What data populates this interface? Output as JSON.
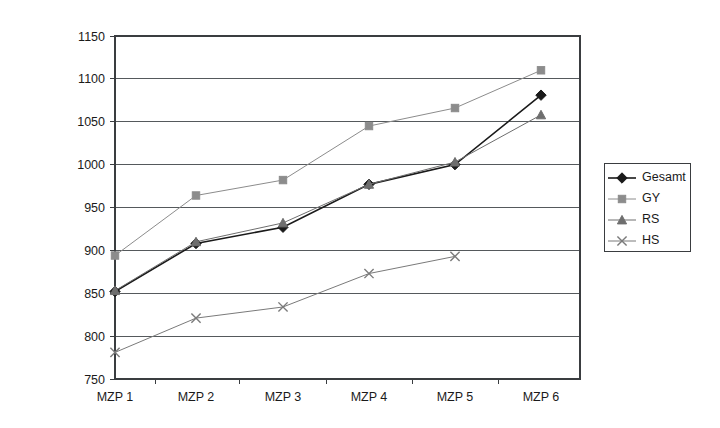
{
  "chart_data": {
    "type": "line",
    "title": "",
    "xlabel": "",
    "ylabel": "",
    "categories": [
      "MZP 1",
      "MZP 2",
      "MZP 3",
      "MZP 4",
      "MZP 5",
      "MZP 6"
    ],
    "ylim": [
      750,
      1150
    ],
    "yticks": [
      750,
      800,
      850,
      900,
      950,
      1000,
      1050,
      1100,
      1150
    ],
    "grid": true,
    "legend_position": "right",
    "series": [
      {
        "name": "Gesamt",
        "marker": "diamond",
        "color": "#1a1a1a",
        "values": [
          852,
          908,
          927,
          977,
          1000,
          1081
        ]
      },
      {
        "name": "GY",
        "marker": "square",
        "color": "#8c8c8c",
        "values": [
          894,
          964,
          982,
          1045,
          1066,
          1110
        ]
      },
      {
        "name": "RS",
        "marker": "triangle",
        "color": "#6e6e6e",
        "values": [
          853,
          910,
          932,
          977,
          1003,
          1058
        ]
      },
      {
        "name": "HS",
        "marker": "cross",
        "color": "#7a7a7a",
        "values": [
          781,
          821,
          834,
          873,
          893,
          null
        ]
      }
    ]
  },
  "legend": {
    "items": [
      {
        "label": "Gesamt",
        "marker": "diamond",
        "color": "#1a1a1a"
      },
      {
        "label": "GY",
        "marker": "square",
        "color": "#8c8c8c"
      },
      {
        "label": "RS",
        "marker": "triangle",
        "color": "#6e6e6e"
      },
      {
        "label": "HS",
        "marker": "cross",
        "color": "#7a7a7a"
      }
    ]
  },
  "axes": {
    "y_tick_labels": [
      "1150",
      "1100",
      "1050",
      "1000",
      "950",
      "900",
      "850",
      "800",
      "750"
    ],
    "x_tick_labels": [
      "MZP 1",
      "MZP 2",
      "MZP 3",
      "MZP 4",
      "MZP 5",
      "MZP 6"
    ]
  },
  "geometry": {
    "plot_left": 115,
    "plot_right": 580,
    "plot_top": 36,
    "plot_bottom": 379,
    "x_positions": [
      115,
      196,
      283,
      369,
      455,
      541
    ],
    "legend_x": 604,
    "legend_y": 163,
    "legend_w": 86,
    "legend_h": 88
  }
}
